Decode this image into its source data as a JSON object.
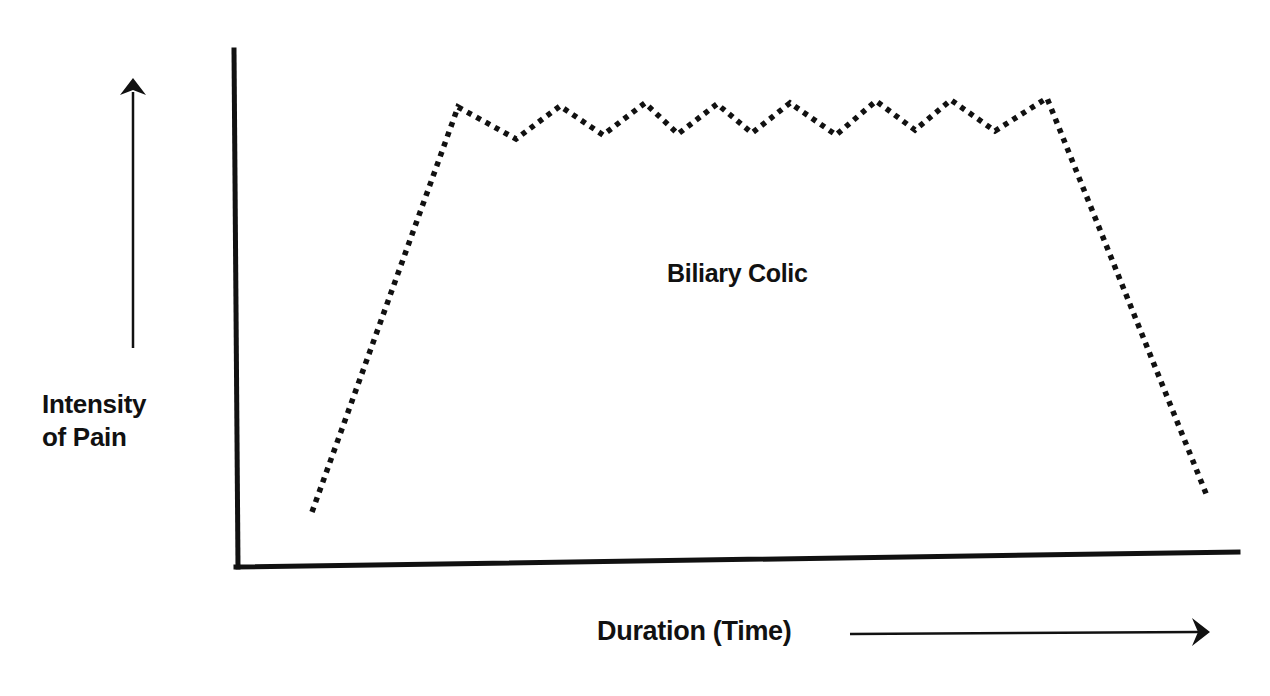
{
  "figure": {
    "annotation": "Biliary Colic",
    "y_axis_label_line1": "Intensity",
    "y_axis_label_line2": "of Pain",
    "x_axis_label": "Duration (Time)",
    "icons": {
      "y_direction": "arrow-up-icon",
      "x_direction": "arrow-right-icon"
    },
    "colors": {
      "ink": "#111111",
      "background": "#ffffff"
    }
  },
  "chart_data": {
    "type": "line",
    "title": "",
    "annotation": "Biliary Colic",
    "xlabel": "Duration (Time)",
    "ylabel": "Intensity of Pain",
    "line_style": "dotted",
    "axis_ticks": "none",
    "grid": false,
    "legend": "none",
    "points": [
      {
        "x": 312,
        "y": 512
      },
      {
        "x": 458,
        "y": 107
      },
      {
        "x": 516,
        "y": 139
      },
      {
        "x": 560,
        "y": 106
      },
      {
        "x": 603,
        "y": 135
      },
      {
        "x": 645,
        "y": 103
      },
      {
        "x": 678,
        "y": 134
      },
      {
        "x": 717,
        "y": 104
      },
      {
        "x": 752,
        "y": 133
      },
      {
        "x": 790,
        "y": 103
      },
      {
        "x": 836,
        "y": 135
      },
      {
        "x": 876,
        "y": 101
      },
      {
        "x": 915,
        "y": 130
      },
      {
        "x": 951,
        "y": 100
      },
      {
        "x": 995,
        "y": 131
      },
      {
        "x": 1047,
        "y": 98
      },
      {
        "x": 1207,
        "y": 496
      }
    ],
    "points_units": "pixel coordinates (origin top-left); the diagram has no numeric scale"
  }
}
